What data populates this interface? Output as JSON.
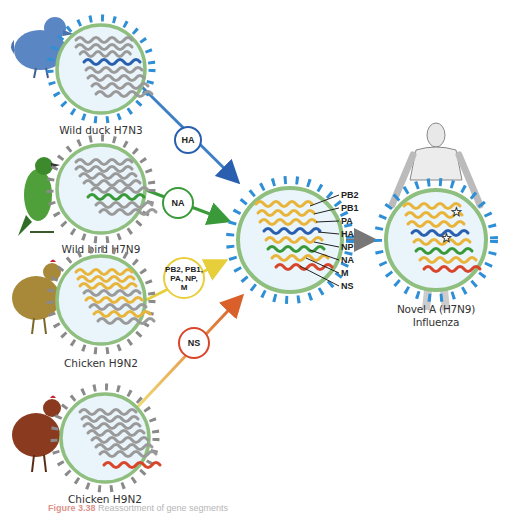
{
  "colors": {
    "membrane": "#8fbf7f",
    "virion_fill": "#eaf5fb",
    "spike_blue": "#2f8fd6",
    "spike_gray": "#8a8a8a",
    "spike_green": "#2f7d32",
    "ha_blue": "#2a5fb0",
    "na_green": "#3a9a3a",
    "internal_gold": "#e8b43a",
    "ns_red": "#d9452a",
    "gray_rna": "#9a9a9a"
  },
  "sources": [
    {
      "id": "duck",
      "label": "Wild duck H7N3",
      "donates": "HA",
      "arrow_color": "#3f7fc6"
    },
    {
      "id": "wildbird",
      "label": "Wild bird H7N9",
      "donates": "NA",
      "arrow_color": "#3a9a3a"
    },
    {
      "id": "chicken1",
      "label": "Chicken H9N2",
      "donates": "PB2, PB1, PA, NP, M",
      "arrow_color": "#e6cf3a"
    },
    {
      "id": "chicken2",
      "label": "Chicken H9N2",
      "donates": "NS",
      "arrow_color": "#d9602a"
    }
  ],
  "bubbles": {
    "ha": "HA",
    "na": "NA",
    "internal_line1": "PB2, PB1,",
    "internal_line2": "PA, NP,",
    "internal_line3": "M",
    "ns": "NS"
  },
  "segments": [
    "PB2",
    "PB1",
    "PA",
    "HA",
    "NP",
    "NA",
    "M",
    "NS"
  ],
  "result": {
    "label_line1": "Novel A (H7N9)",
    "label_line2": "Influenza"
  },
  "caption": {
    "figure": "Figure 3.38",
    "text": "Reassortment of gene segments"
  }
}
